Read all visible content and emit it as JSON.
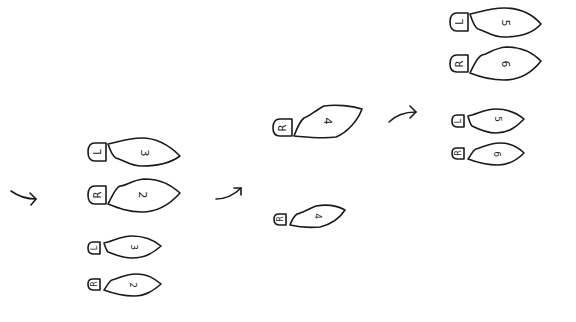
{
  "diagram": {
    "colors": {
      "ink": "#1a1a1a",
      "background": "#ffffff"
    },
    "arrows": [
      {
        "id": "arrow-1",
        "direction": "right"
      },
      {
        "id": "arrow-2",
        "direction": "up-right"
      },
      {
        "id": "arrow-3",
        "direction": "right"
      }
    ],
    "groups": [
      {
        "id": "group-1",
        "large_steps": [
          {
            "foot": "L",
            "step": "3"
          },
          {
            "foot": "R",
            "step": "2"
          }
        ],
        "small_steps": [
          {
            "foot": "L",
            "step": "3"
          },
          {
            "foot": "R",
            "step": "2"
          }
        ]
      },
      {
        "id": "group-2",
        "large_steps": [
          {
            "foot": "R",
            "step": "4"
          }
        ],
        "small_steps": [
          {
            "foot": "R",
            "step": "4"
          }
        ]
      },
      {
        "id": "group-3",
        "large_steps": [
          {
            "foot": "L",
            "step": "5"
          },
          {
            "foot": "R",
            "step": "6"
          }
        ],
        "small_steps": [
          {
            "foot": "L",
            "step": "5"
          },
          {
            "foot": "R",
            "step": "6"
          }
        ]
      }
    ]
  }
}
